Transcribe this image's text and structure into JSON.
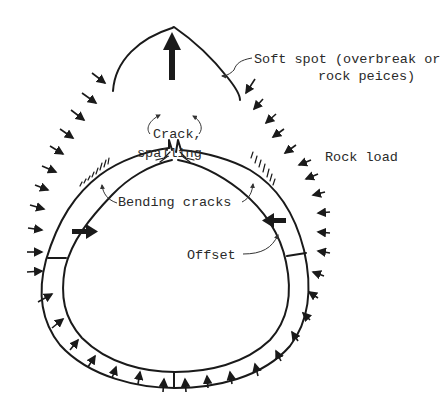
{
  "diagram": {
    "labels": {
      "soft_spot_line1": "Soft spot (overbreak or",
      "soft_spot_line2": "rock peices)",
      "crack_line1": "Crack,",
      "crack_line2": "spalling",
      "rock_load": "Rock load",
      "bending_cracks": "Bending cracks",
      "offset": "Offset"
    },
    "colors": {
      "ink": "#1a1a1a",
      "background": "#ffffff",
      "text": "#2a2a2a"
    }
  }
}
